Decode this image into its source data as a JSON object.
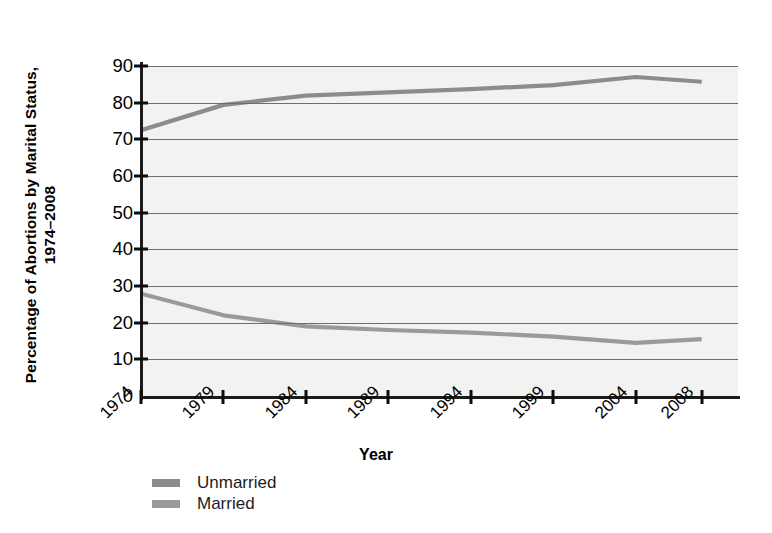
{
  "chart_data": {
    "type": "line",
    "title": "",
    "ylabel_line1": "Percentage of Abortions by Marital Status,",
    "ylabel_line2": "1974–2008",
    "xlabel": "Year",
    "categories": [
      "1974",
      "1979",
      "1984",
      "1989",
      "1994",
      "1999",
      "2004",
      "2008"
    ],
    "x": [
      1974,
      1979,
      1984,
      1989,
      1994,
      1999,
      2004,
      2008
    ],
    "series": [
      {
        "name": "Unmarried",
        "color": "#8c8c8c",
        "values": [
          72.5,
          79.4,
          81.9,
          82.8,
          83.7,
          84.8,
          87.0,
          85.7
        ]
      },
      {
        "name": "Married",
        "color": "#9a9a9a",
        "values": [
          27.9,
          22.0,
          19.0,
          18.0,
          17.3,
          16.2,
          14.5,
          15.5
        ]
      }
    ],
    "yticks": [
      0,
      10,
      20,
      30,
      40,
      50,
      60,
      70,
      80,
      90
    ],
    "ytick_labels": [
      "0",
      "10",
      "20",
      "30",
      "40",
      "50",
      "60",
      "70",
      "80",
      "90"
    ],
    "ylim": [
      0,
      90
    ],
    "xlim": [
      1974,
      2010.2
    ],
    "grid": "horizontal",
    "legend_position": "bottom-left",
    "plot_background": "#f2f2f1",
    "gridline_color": "#6e6e6e",
    "axis_color": "#1a1a1a"
  },
  "legend": {
    "items": [
      {
        "label": "Unmarried",
        "color": "#8c8c8c"
      },
      {
        "label": "Married",
        "color": "#9a9a9a"
      }
    ]
  }
}
